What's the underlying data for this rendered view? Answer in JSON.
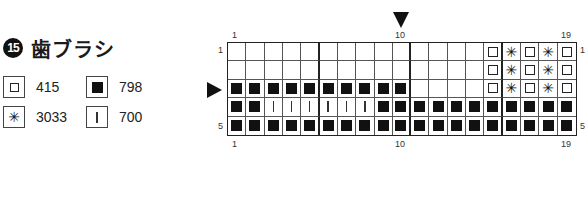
{
  "title": {
    "number": "15",
    "text": "歯ブラシ"
  },
  "legend": [
    {
      "symbol": "empty-square",
      "code": "415"
    },
    {
      "symbol": "filled-square",
      "code": "798"
    },
    {
      "symbol": "asterisk",
      "code": "3033"
    },
    {
      "symbol": "vertical-bar",
      "code": "700"
    }
  ],
  "chart": {
    "columns": 19,
    "rows": 5,
    "top_labels": {
      "first": "1",
      "center": "10",
      "last": "19"
    },
    "bottom_labels": {
      "first": "1",
      "center": "10",
      "last": "19"
    },
    "left_labels": {
      "first": "1",
      "last": "5"
    },
    "right_labels": {
      "first": "1",
      "last": "5"
    },
    "center_column_marker": "10",
    "center_row_marker": "3",
    "cells": [
      [
        "",
        "",
        "",
        "",
        "",
        "",
        "",
        "",
        "",
        "",
        "",
        "",
        "",
        "",
        "O",
        "*",
        "O",
        "*",
        "O"
      ],
      [
        "",
        "",
        "",
        "",
        "",
        "",
        "",
        "",
        "",
        "",
        "",
        "",
        "",
        "",
        "O",
        "*",
        "O",
        "*",
        "O"
      ],
      [
        "B",
        "B",
        "B",
        "B",
        "B",
        "B",
        "B",
        "B",
        "B",
        "B",
        "",
        "",
        "",
        "",
        "O",
        "*",
        "O",
        "*",
        "O"
      ],
      [
        "B",
        "B",
        "|",
        "|",
        "|",
        "|",
        "|",
        "|",
        "B",
        "B",
        "B",
        "B",
        "B",
        "B",
        "B",
        "B",
        "B",
        "B",
        "B"
      ],
      [
        "B",
        "B",
        "B",
        "B",
        "B",
        "B",
        "B",
        "B",
        "B",
        "B",
        "B",
        "B",
        "B",
        "B",
        "B",
        "B",
        "B",
        "B",
        "B"
      ]
    ],
    "key": {
      "O": "415",
      "B": "798",
      "*": "3033",
      "|": "700"
    }
  }
}
